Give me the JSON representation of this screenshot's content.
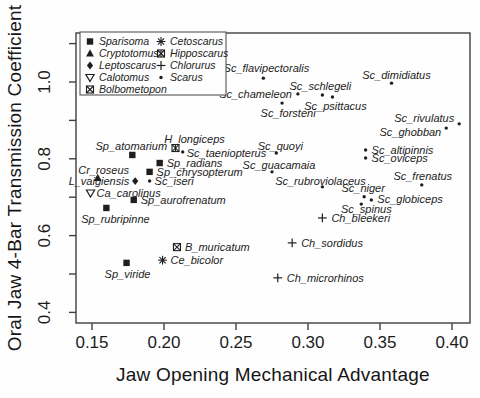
{
  "figure": {
    "type": "scatter-plot-figure"
  },
  "chart_data": {
    "type": "scatter",
    "title": "",
    "xlabel": "Jaw Opening Mechanical Advantage",
    "ylabel": "Oral Jaw 4-Bar Transmission Coefficient",
    "xlim": [
      0.1389,
      0.4125
    ],
    "ylim": [
      0.3724,
      1.1276
    ],
    "grid": false,
    "ink_color": "#1e1e1e",
    "frame_color": "#3f3f3f",
    "x_ticks": [
      {
        "v": 0.15,
        "label": "0.15"
      },
      {
        "v": 0.2,
        "label": "0.20"
      },
      {
        "v": 0.25,
        "label": "0.25"
      },
      {
        "v": 0.3,
        "label": "0.30"
      },
      {
        "v": 0.35,
        "label": "0.35"
      },
      {
        "v": 0.4,
        "label": "0.40"
      }
    ],
    "y_ticks": [
      {
        "v": 0.4,
        "label": "0.4"
      },
      {
        "v": 0.5,
        "label": ""
      },
      {
        "v": 0.6,
        "label": "0.6"
      },
      {
        "v": 0.7,
        "label": ""
      },
      {
        "v": 0.8,
        "label": "0.8"
      },
      {
        "v": 0.9,
        "label": ""
      },
      {
        "v": 1.0,
        "label": "1.0"
      },
      {
        "v": 1.1,
        "label": ""
      }
    ],
    "genus_symbols": {
      "Sparisoma": "filled-square",
      "Cryptotomus": "filled-triangle",
      "Leptoscarus": "filled-diamond",
      "Calotomus": "open-triangle-down",
      "Bolbometopon": "square-x",
      "Cetoscarus": "asterisk",
      "Hipposcarus": "square-asterisk",
      "Chlorurus": "plus",
      "Scarus": "dot"
    },
    "legend": {
      "position": "top-left",
      "columns": [
        [
          {
            "label": "Sparisoma",
            "symbol": "filled-square"
          },
          {
            "label": "Cryptotomus",
            "symbol": "filled-triangle"
          },
          {
            "label": "Leptoscarus",
            "symbol": "filled-diamond"
          },
          {
            "label": "Calotomus",
            "symbol": "open-triangle-down"
          },
          {
            "label": "Bolbometopon",
            "symbol": "square-x"
          }
        ],
        [
          {
            "label": "Cetoscarus",
            "symbol": "asterisk"
          },
          {
            "label": "Hipposcarus",
            "symbol": "square-asterisk"
          },
          {
            "label": "Chlorurus",
            "symbol": "plus"
          },
          {
            "label": "Scarus",
            "symbol": "dot"
          }
        ]
      ]
    },
    "points": [
      {
        "label": "Sc_flavipectoralis",
        "genus": "Scarus",
        "x": 0.269,
        "y": 1.01,
        "dx": 3,
        "dy": -6,
        "anchor": "middle"
      },
      {
        "label": "Sc_schlegeli",
        "genus": "Scarus",
        "x": 0.31,
        "y": 0.966,
        "dx": -2,
        "dy": -5,
        "anchor": "middle"
      },
      {
        "label": "Sc_chameleon",
        "genus": "Scarus",
        "x": 0.293,
        "y": 0.969,
        "dx": -6,
        "dy": 4,
        "anchor": "end"
      },
      {
        "label": "Sc_psittacus",
        "genus": "Scarus",
        "x": 0.317,
        "y": 0.961,
        "dx": 3,
        "dy": 13,
        "anchor": "middle"
      },
      {
        "label": "Sc_forsteni",
        "genus": "Scarus",
        "x": 0.282,
        "y": 0.945,
        "dx": 6,
        "dy": 14,
        "anchor": "middle"
      },
      {
        "label": "Sc_dimidiatus",
        "genus": "Scarus",
        "x": 0.358,
        "y": 0.997,
        "dx": 5,
        "dy": -4,
        "anchor": "middle"
      },
      {
        "label": "Sc_rivulatus",
        "genus": "Scarus",
        "x": 0.405,
        "y": 0.891,
        "dx": -5,
        "dy": -2,
        "anchor": "end"
      },
      {
        "label": "Sc_ghobban",
        "genus": "Scarus",
        "x": 0.396,
        "y": 0.88,
        "dx": -5,
        "dy": 8,
        "anchor": "end"
      },
      {
        "label": "Sc_quoyi",
        "genus": "Scarus",
        "x": 0.278,
        "y": 0.815,
        "dx": 4,
        "dy": -3,
        "anchor": "middle"
      },
      {
        "label": "Sc_altipinnis",
        "genus": "Scarus",
        "x": 0.34,
        "y": 0.823,
        "dx": 6,
        "dy": 4,
        "anchor": "start"
      },
      {
        "label": "Sc_oviceps",
        "genus": "Scarus",
        "x": 0.34,
        "y": 0.802,
        "dx": 6,
        "dy": 4,
        "anchor": "start"
      },
      {
        "label": "Sc_guacamaia",
        "genus": "Scarus",
        "x": 0.275,
        "y": 0.766,
        "dx": 7,
        "dy": -3,
        "anchor": "middle"
      },
      {
        "label": "Sc_rubroviolaceus",
        "genus": "Scarus",
        "x": 0.31,
        "y": 0.727,
        "dx": -2,
        "dy": -2,
        "anchor": "middle"
      },
      {
        "label": "Sc_frenatus",
        "genus": "Scarus",
        "x": 0.379,
        "y": 0.732,
        "dx": 1,
        "dy": -5,
        "anchor": "middle"
      },
      {
        "label": "Sc_niger",
        "genus": "Scarus",
        "x": 0.339,
        "y": 0.701,
        "dx": -1,
        "dy": -5,
        "anchor": "middle"
      },
      {
        "label": "Sc_globiceps",
        "genus": "Scarus",
        "x": 0.344,
        "y": 0.693,
        "dx": 6,
        "dy": 3,
        "anchor": "start"
      },
      {
        "label": "Sc_spinus",
        "genus": "Scarus",
        "x": 0.337,
        "y": 0.682,
        "dx": 5,
        "dy": 9,
        "anchor": "middle"
      },
      {
        "label": "Sc_iseri",
        "genus": "Scarus",
        "x": 0.19,
        "y": 0.742,
        "dx": 5,
        "dy": 4,
        "anchor": "start"
      },
      {
        "label": "Sc_taeniopterus",
        "genus": "Scarus",
        "x": 0.213,
        "y": 0.818,
        "dx": 4,
        "dy": 5,
        "anchor": "start"
      },
      {
        "label": "Sp_atomarium",
        "genus": "Sparisoma",
        "x": 0.178,
        "y": 0.81,
        "dx": -1,
        "dy": -5,
        "anchor": "middle"
      },
      {
        "label": "Sp_radians",
        "genus": "Sparisoma",
        "x": 0.197,
        "y": 0.789,
        "dx": 7,
        "dy": 4,
        "anchor": "start"
      },
      {
        "label": "Sp_chrysopterum",
        "genus": "Sparisoma",
        "x": 0.19,
        "y": 0.766,
        "dx": 7,
        "dy": 4,
        "anchor": "start"
      },
      {
        "label": "Sp_aurofrenatum",
        "genus": "Sparisoma",
        "x": 0.179,
        "y": 0.693,
        "dx": 7,
        "dy": 4,
        "anchor": "start"
      },
      {
        "label": "Sp_rubripinne",
        "genus": "Sparisoma",
        "x": 0.16,
        "y": 0.672,
        "dx": 9,
        "dy": 15,
        "anchor": "middle"
      },
      {
        "label": "Sp_viride",
        "genus": "Sparisoma",
        "x": 0.174,
        "y": 0.529,
        "dx": 1,
        "dy": 15,
        "anchor": "middle"
      },
      {
        "label": "Cr_roseus",
        "genus": "Cryptotomus",
        "x": 0.154,
        "y": 0.75,
        "dx": 6,
        "dy": -4,
        "anchor": "middle"
      },
      {
        "label": "L_vaigiensis",
        "genus": "Leptoscarus",
        "x": 0.18,
        "y": 0.742,
        "dx": -6,
        "dy": 4,
        "anchor": "end"
      },
      {
        "label": "Ca_carolinus",
        "genus": "Calotomus",
        "x": 0.149,
        "y": 0.711,
        "dx": 6,
        "dy": 4,
        "anchor": "start"
      },
      {
        "label": "B_muricatum",
        "genus": "Bolbometopon",
        "x": 0.209,
        "y": 0.57,
        "dx": 8,
        "dy": 4,
        "anchor": "start"
      },
      {
        "label": "Ce_bicolor",
        "genus": "Cetoscarus",
        "x": 0.199,
        "y": 0.536,
        "dx": 8,
        "dy": 4,
        "anchor": "start"
      },
      {
        "label": "H_longiceps",
        "genus": "Hipposcarus",
        "x": 0.208,
        "y": 0.828,
        "dx": 19,
        "dy": -5,
        "anchor": "middle"
      },
      {
        "label": "Ch_bleekeri",
        "genus": "Chlorurus",
        "x": 0.31,
        "y": 0.646,
        "dx": 9,
        "dy": 4,
        "anchor": "start"
      },
      {
        "label": "Ch_sordidus",
        "genus": "Chlorurus",
        "x": 0.289,
        "y": 0.581,
        "dx": 9,
        "dy": 4,
        "anchor": "start"
      },
      {
        "label": "Ch_microrhinos",
        "genus": "Chlorurus",
        "x": 0.279,
        "y": 0.49,
        "dx": 9,
        "dy": 4,
        "anchor": "start"
      }
    ]
  }
}
